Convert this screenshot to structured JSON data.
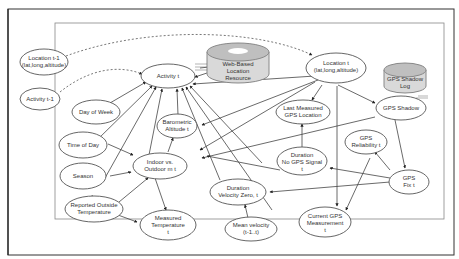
{
  "diagram": {
    "type": "bayesian-network",
    "nodes": {
      "location_prev": {
        "line1": "Location t-1",
        "line2": "(lat,long,altitude)"
      },
      "activity_prev": {
        "line1": "Activity t-1"
      },
      "activity": {
        "line1": "Activity t"
      },
      "web_resource": {
        "line1": "Web-Based",
        "line2": "Location",
        "line3": "Resource"
      },
      "location": {
        "line1": "Location t",
        "line2": "(lat,long,altitude)"
      },
      "gps_shadow_log": {
        "line1": "GPS Shadow",
        "line2": "Log"
      },
      "day_of_week": {
        "line1": "Day of Week"
      },
      "barometric_altitude": {
        "line1": "Barometric",
        "line2": "Altitude t"
      },
      "last_measured_gps": {
        "line1": "Last Measured",
        "line2": "GPS Location"
      },
      "gps_shadow": {
        "line1": "GPS Shadow"
      },
      "time_of_day": {
        "line1": "Time of Day"
      },
      "indoor_outdoor": {
        "line1": "Indoor vs.",
        "line2": "Outdoor m t"
      },
      "duration_no_gps": {
        "line1": "Duration",
        "line2": "No GPS Signal",
        "line3": "t"
      },
      "gps_reliability": {
        "line1": "GPS",
        "line2": "Reliability t"
      },
      "season": {
        "line1": "Season"
      },
      "duration_velocity_zero": {
        "line1": "Duration",
        "line2": "Velocity Zero, t"
      },
      "gps_fix": {
        "line1": "GPS",
        "line2": "Fix t"
      },
      "reported_outside_temp": {
        "line1": "Reported Outside",
        "line2": "Temperature"
      },
      "measured_temperature": {
        "line1": "Measured",
        "line2": "Temperature",
        "line3": "t"
      },
      "mean_velocity": {
        "line1": "Mean velocity",
        "line2": "(t-1..t)"
      },
      "current_gps": {
        "line1": "Current GPS",
        "line2": "Measurement",
        "line3": "t"
      }
    },
    "colors": {
      "line": "#444444",
      "node_fill": "#ffffff",
      "database_fill": "#d9d9d9",
      "database_top": "#bfbfbf"
    }
  }
}
